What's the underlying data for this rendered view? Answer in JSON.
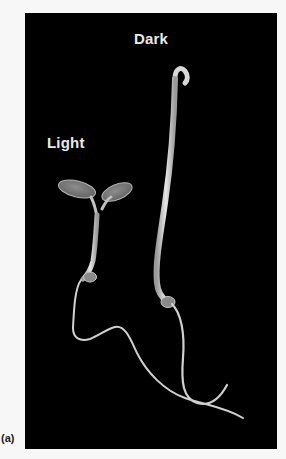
{
  "figure": {
    "panel_label": "(a)",
    "background_color": "#000000",
    "page_color": "#f7f7f7",
    "seedlings": [
      {
        "label": "Light",
        "description": "seedling grown in light with open expanded cotyledons, short hypocotyl"
      },
      {
        "label": "Dark",
        "description": "etiolated seedling grown in dark with long hypocotyl and apical hook"
      }
    ]
  }
}
